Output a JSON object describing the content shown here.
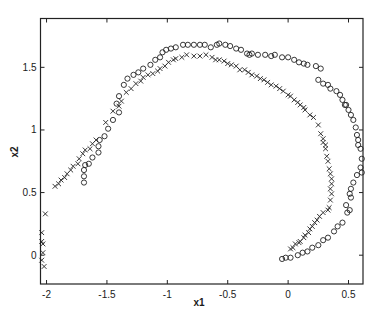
{
  "chart_data": {
    "type": "scatter",
    "title": "",
    "xlabel": "x1",
    "ylabel": "x2",
    "xlim": [
      -2.05,
      0.62
    ],
    "ylim": [
      -0.23,
      1.89
    ],
    "grid": false,
    "legend": null,
    "xticks": [
      -2,
      -1.5,
      -1,
      -0.5,
      0,
      0.5
    ],
    "xtick_labels": [
      "-2",
      "-1.5",
      "-1",
      "-0.5",
      "0",
      "0.5"
    ],
    "yticks": [
      0,
      0.5,
      1,
      1.5
    ],
    "ytick_labels": [
      "0",
      "0.5",
      "1",
      "1.5"
    ],
    "series": [
      {
        "name": "circles",
        "marker": "o",
        "color": "#222222",
        "points": [
          [
            -1.69,
            0.68
          ],
          [
            -1.69,
            0.63
          ],
          [
            -1.69,
            0.58
          ],
          [
            -1.68,
            0.72
          ],
          [
            -1.65,
            0.73
          ],
          [
            -1.62,
            0.78
          ],
          [
            -1.57,
            0.87
          ],
          [
            -1.57,
            0.82
          ],
          [
            -1.56,
            0.92
          ],
          [
            -1.52,
            0.95
          ],
          [
            -1.49,
            1.01
          ],
          [
            -1.45,
            1.08
          ],
          [
            -1.4,
            1.14
          ],
          [
            -1.42,
            1.21
          ],
          [
            -1.4,
            1.27
          ],
          [
            -1.36,
            1.36
          ],
          [
            -1.33,
            1.41
          ],
          [
            -1.28,
            1.44
          ],
          [
            -1.24,
            1.46
          ],
          [
            -1.2,
            1.49
          ],
          [
            -1.14,
            1.52
          ],
          [
            -1.1,
            1.56
          ],
          [
            -1.06,
            1.58
          ],
          [
            -1.04,
            1.62
          ],
          [
            -1.01,
            1.64
          ],
          [
            -0.97,
            1.65
          ],
          [
            -0.93,
            1.66
          ],
          [
            -0.87,
            1.68
          ],
          [
            -0.83,
            1.68
          ],
          [
            -0.78,
            1.68
          ],
          [
            -0.73,
            1.68
          ],
          [
            -0.69,
            1.68
          ],
          [
            -0.64,
            1.66
          ],
          [
            -0.59,
            1.68
          ],
          [
            -0.57,
            1.69
          ],
          [
            -0.52,
            1.68
          ],
          [
            -0.48,
            1.67
          ],
          [
            -0.43,
            1.65
          ],
          [
            -0.39,
            1.64
          ],
          [
            -0.34,
            1.61
          ],
          [
            -0.32,
            1.6
          ],
          [
            -0.3,
            1.61
          ],
          [
            -0.25,
            1.6
          ],
          [
            -0.19,
            1.6
          ],
          [
            -0.14,
            1.59
          ],
          [
            -0.11,
            1.6
          ],
          [
            -0.05,
            1.58
          ],
          [
            0.0,
            1.58
          ],
          [
            0.05,
            1.56
          ],
          [
            0.09,
            1.54
          ],
          [
            0.13,
            1.53
          ],
          [
            0.16,
            1.52
          ],
          [
            0.23,
            1.51
          ],
          [
            0.27,
            1.49
          ],
          [
            0.25,
            1.4
          ],
          [
            0.29,
            1.37
          ],
          [
            0.33,
            1.36
          ],
          [
            0.35,
            1.33
          ],
          [
            0.4,
            1.31
          ],
          [
            0.43,
            1.28
          ],
          [
            0.45,
            1.24
          ],
          [
            0.47,
            1.2
          ],
          [
            0.48,
            1.2
          ],
          [
            0.5,
            1.16
          ],
          [
            0.52,
            1.12
          ],
          [
            0.54,
            1.08
          ],
          [
            0.56,
            1.02
          ],
          [
            0.57,
            0.96
          ],
          [
            0.58,
            0.92
          ],
          [
            0.58,
            0.88
          ],
          [
            0.6,
            0.85
          ],
          [
            0.61,
            0.77
          ],
          [
            0.6,
            0.7
          ],
          [
            0.61,
            0.66
          ],
          [
            0.57,
            0.64
          ],
          [
            0.54,
            0.58
          ],
          [
            0.52,
            0.53
          ],
          [
            0.51,
            0.49
          ],
          [
            0.52,
            0.46
          ],
          [
            0.48,
            0.4
          ],
          [
            0.51,
            0.36
          ],
          [
            0.49,
            0.34
          ],
          [
            0.45,
            0.26
          ],
          [
            0.41,
            0.23
          ],
          [
            0.38,
            0.19
          ],
          [
            0.33,
            0.14
          ],
          [
            0.29,
            0.12
          ],
          [
            0.25,
            0.08
          ],
          [
            0.2,
            0.06
          ],
          [
            0.16,
            0.03
          ],
          [
            0.12,
            0.02
          ],
          [
            0.08,
            0.0
          ],
          [
            0.02,
            -0.02
          ],
          [
            -0.02,
            -0.02
          ],
          [
            -0.05,
            -0.03
          ]
        ]
      },
      {
        "name": "crosses",
        "marker": "x",
        "color": "#222222",
        "points": [
          [
            -2.04,
            0.18
          ],
          [
            -2.04,
            0.11
          ],
          [
            -2.03,
            0.09
          ],
          [
            -2.03,
            0.02
          ],
          [
            -2.04,
            -0.04
          ],
          [
            -2.02,
            -0.09
          ],
          [
            -2.01,
            0.33
          ],
          [
            -1.93,
            0.55
          ],
          [
            -1.9,
            0.57
          ],
          [
            -1.88,
            0.6
          ],
          [
            -1.85,
            0.62
          ],
          [
            -1.83,
            0.65
          ],
          [
            -1.8,
            0.68
          ],
          [
            -1.78,
            0.71
          ],
          [
            -1.74,
            0.73
          ],
          [
            -1.73,
            0.77
          ],
          [
            -1.7,
            0.81
          ],
          [
            -1.68,
            0.84
          ],
          [
            -1.64,
            0.85
          ],
          [
            -1.62,
            0.89
          ],
          [
            -1.59,
            0.92
          ],
          [
            -1.51,
            1.06
          ],
          [
            -1.45,
            1.15
          ],
          [
            -1.4,
            1.19
          ],
          [
            -1.38,
            1.23
          ],
          [
            -1.34,
            1.3
          ],
          [
            -1.3,
            1.33
          ],
          [
            -1.26,
            1.37
          ],
          [
            -1.22,
            1.39
          ],
          [
            -1.2,
            1.42
          ],
          [
            -1.16,
            1.44
          ],
          [
            -1.12,
            1.45
          ],
          [
            -1.08,
            1.47
          ],
          [
            -1.06,
            1.49
          ],
          [
            -1.02,
            1.51
          ],
          [
            -0.99,
            1.54
          ],
          [
            -0.95,
            1.56
          ],
          [
            -0.93,
            1.57
          ],
          [
            -0.88,
            1.58
          ],
          [
            -0.84,
            1.6
          ],
          [
            -0.78,
            1.59
          ],
          [
            -0.73,
            1.59
          ],
          [
            -0.68,
            1.6
          ],
          [
            -0.63,
            1.58
          ],
          [
            -0.6,
            1.56
          ],
          [
            -0.57,
            1.56
          ],
          [
            -0.53,
            1.55
          ],
          [
            -0.5,
            1.53
          ],
          [
            -0.47,
            1.52
          ],
          [
            -0.43,
            1.51
          ],
          [
            -0.4,
            1.48
          ],
          [
            -0.36,
            1.48
          ],
          [
            -0.33,
            1.46
          ],
          [
            -0.3,
            1.44
          ],
          [
            -0.26,
            1.43
          ],
          [
            -0.23,
            1.41
          ],
          [
            -0.2,
            1.4
          ],
          [
            -0.17,
            1.38
          ],
          [
            -0.14,
            1.36
          ],
          [
            -0.1,
            1.35
          ],
          [
            -0.07,
            1.33
          ],
          [
            -0.04,
            1.31
          ],
          [
            0.0,
            1.28
          ],
          [
            0.02,
            1.27
          ],
          [
            0.05,
            1.24
          ],
          [
            0.08,
            1.22
          ],
          [
            0.1,
            1.2
          ],
          [
            0.13,
            1.18
          ],
          [
            0.14,
            1.16
          ],
          [
            0.18,
            1.12
          ],
          [
            0.21,
            1.1
          ],
          [
            0.25,
            1.04
          ],
          [
            0.27,
            0.97
          ],
          [
            0.29,
            0.93
          ],
          [
            0.29,
            0.9
          ],
          [
            0.31,
            0.88
          ],
          [
            0.31,
            0.85
          ],
          [
            0.32,
            0.79
          ],
          [
            0.33,
            0.75
          ],
          [
            0.34,
            0.69
          ],
          [
            0.35,
            0.65
          ],
          [
            0.36,
            0.61
          ],
          [
            0.36,
            0.57
          ],
          [
            0.35,
            0.53
          ],
          [
            0.36,
            0.49
          ],
          [
            0.35,
            0.44
          ],
          [
            0.34,
            0.38
          ],
          [
            0.33,
            0.36
          ],
          [
            0.29,
            0.34
          ],
          [
            0.26,
            0.31
          ],
          [
            0.24,
            0.28
          ],
          [
            0.22,
            0.26
          ],
          [
            0.2,
            0.23
          ],
          [
            0.18,
            0.21
          ],
          [
            0.17,
            0.18
          ],
          [
            0.14,
            0.16
          ],
          [
            0.13,
            0.14
          ],
          [
            0.1,
            0.11
          ],
          [
            0.09,
            0.1
          ],
          [
            0.06,
            0.09
          ],
          [
            0.04,
            0.06
          ],
          [
            0.02,
            0.05
          ]
        ]
      }
    ]
  }
}
